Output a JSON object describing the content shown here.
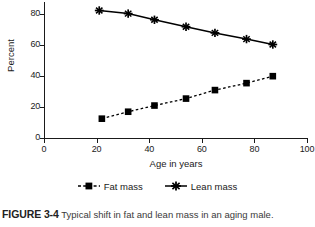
{
  "figure": {
    "number_label": "FIGURE 3-4",
    "caption_text": "Typical shift in fat and lean mass in an aging male."
  },
  "chart_data": {
    "type": "line",
    "title": "",
    "xlabel": "Age in years",
    "ylabel": "Percent",
    "xlim": [
      0,
      100
    ],
    "ylim": [
      0,
      88
    ],
    "xticks": [
      0,
      20,
      40,
      60,
      80,
      100
    ],
    "yticks": [
      0,
      20,
      40,
      60,
      80
    ],
    "xticklabels": [
      "0",
      "20",
      "40",
      "60",
      "80",
      "100"
    ],
    "yticklabels": [
      "0",
      "20",
      "40",
      "60",
      "80"
    ],
    "grid": false,
    "legend_position": "below-axes",
    "series": [
      {
        "name": "Fat mass",
        "marker": "square",
        "linestyle": "dashed",
        "color": "#000000",
        "x": [
          22,
          32,
          42,
          54,
          65,
          77,
          87
        ],
        "values": [
          12.5,
          17,
          21,
          25.5,
          31,
          35.5,
          40
        ]
      },
      {
        "name": "Lean mass",
        "marker": "star",
        "linestyle": "solid",
        "color": "#000000",
        "x": [
          21,
          32,
          42,
          54,
          65,
          77,
          87
        ],
        "values": [
          82.5,
          80.5,
          76.5,
          72,
          68,
          64,
          60.5
        ]
      }
    ]
  },
  "legend": {
    "items": [
      {
        "label": "Fat mass",
        "marker": "square-dashed-icon"
      },
      {
        "label": "Lean mass",
        "marker": "star-solid-icon"
      }
    ]
  }
}
